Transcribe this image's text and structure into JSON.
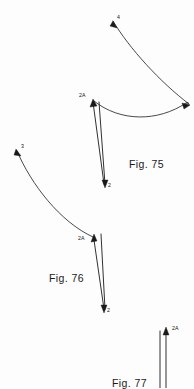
{
  "document": {
    "kind": "patent-figure-sheet",
    "background_color": "#fdfdfd",
    "ink_color": "#1a1a1a"
  },
  "figures": [
    {
      "id": "fig-75",
      "caption": "Fig. 75",
      "caption_pos": {
        "x": 129,
        "y": 158
      },
      "labels": [
        {
          "name": "label-4",
          "text": "4",
          "x": 117,
          "y": 17
        },
        {
          "name": "label-5",
          "text": "5",
          "x": 186,
          "y": 104
        },
        {
          "name": "label-2a",
          "text": "2A",
          "x": 80,
          "y": 95
        },
        {
          "name": "label-2",
          "text": "2",
          "x": 107,
          "y": 185
        }
      ],
      "curves": [
        {
          "name": "upper-trajectory-curve",
          "d": "M 113 21 C 129 48, 160 82, 189 104"
        },
        {
          "name": "lower-sag-curve",
          "d": "M 94 101 C 120 122, 158 122, 186 103"
        }
      ],
      "arrows": [
        {
          "name": "arrow-4-head",
          "kind": "arrowhead-up-left",
          "d": "M 113 21 L 117 28 L 110 26 Z"
        },
        {
          "name": "arrow-5-head",
          "kind": "arrowhead-right",
          "d": "M 190 105 L 182 103 L 184 109 Z"
        },
        {
          "name": "shaft-left-up",
          "kind": "line",
          "d": "M 104 184 L 93 102"
        },
        {
          "name": "shaft-right-up",
          "kind": "line",
          "d": "M 105 184 L 99 102"
        },
        {
          "name": "arrow-2a-head",
          "kind": "arrowhead-up",
          "d": "M 93 99 L 90 107 L 97 106 Z"
        },
        {
          "name": "arrow-2-head",
          "kind": "arrowhead-down",
          "d": "M 105 188 L 102 180 L 108 180 Z"
        }
      ]
    },
    {
      "id": "fig-76",
      "caption": "Fig. 76",
      "caption_pos": {
        "x": 49,
        "y": 272
      },
      "labels": [
        {
          "name": "label-3",
          "text": "3",
          "x": 21,
          "y": 146
        },
        {
          "name": "label-2a",
          "text": "2A",
          "x": 79,
          "y": 238
        },
        {
          "name": "label-2",
          "text": "2",
          "x": 106,
          "y": 310
        }
      ],
      "curves": [
        {
          "name": "left-trajectory-curve",
          "d": "M 17 151 C 31 184, 60 222, 93 237"
        }
      ],
      "arrows": [
        {
          "name": "arrow-3-head",
          "kind": "arrowhead-up-left",
          "d": "M 16 149 L 21 156 L 14 155 Z"
        },
        {
          "name": "shaft-left-up",
          "kind": "line",
          "d": "M 104 309 L 94 240"
        },
        {
          "name": "shaft-right-up",
          "kind": "line",
          "d": "M 105 309 L 101 234"
        },
        {
          "name": "arrow-2a-head",
          "kind": "arrowhead-up",
          "d": "M 94 234 L 91 242 L 97 241 Z"
        },
        {
          "name": "arrow-2-head",
          "kind": "arrowhead-down",
          "d": "M 104 313 L 101 305 L 107 305 Z"
        }
      ]
    },
    {
      "id": "fig-77",
      "caption": "Fig. 77",
      "caption_pos": {
        "x": 112,
        "y": 377
      },
      "labels": [
        {
          "name": "label-2a",
          "text": "2A",
          "x": 172,
          "y": 328
        }
      ],
      "curves": [],
      "arrows": [
        {
          "name": "shaft-left-up",
          "kind": "line",
          "d": "M 160 388 L 160 331"
        },
        {
          "name": "shaft-right-up",
          "kind": "line",
          "d": "M 166 388 L 166 331"
        },
        {
          "name": "arrow-2a-head",
          "kind": "arrowhead-up",
          "d": "M 166 327 L 163 335 L 169 335 Z"
        }
      ]
    }
  ]
}
